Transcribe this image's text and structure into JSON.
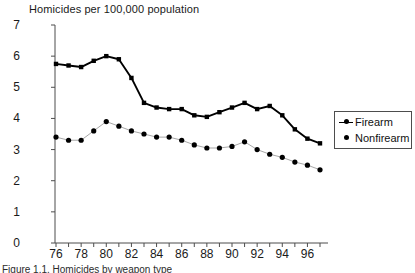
{
  "chart_data": {
    "type": "line",
    "title": "Homicides per 100,000 population",
    "xlabel": "",
    "ylabel": "",
    "ylim": [
      0,
      7
    ],
    "xlim": [
      1976,
      1997
    ],
    "yticks": [
      0,
      1,
      2,
      3,
      4,
      5,
      6,
      7
    ],
    "xticks": [
      1976,
      1977,
      1978,
      1979,
      1980,
      1981,
      1982,
      1983,
      1984,
      1985,
      1986,
      1987,
      1988,
      1989,
      1990,
      1991,
      1992,
      1993,
      1994,
      1995,
      1996,
      1997
    ],
    "xtick_labels_shown": [
      "76",
      "78",
      "80",
      "82",
      "84",
      "86",
      "88",
      "90",
      "92",
      "94",
      "96"
    ],
    "xtick_label_years": [
      1976,
      1978,
      1980,
      1982,
      1984,
      1986,
      1988,
      1990,
      1992,
      1994,
      1996
    ],
    "ytick_labels": [
      "0",
      "1",
      "2",
      "3",
      "4",
      "5",
      "6",
      "7"
    ],
    "grid": false,
    "legend_position": "right",
    "x": [
      1976,
      1977,
      1978,
      1979,
      1980,
      1981,
      1982,
      1983,
      1984,
      1985,
      1986,
      1987,
      1988,
      1989,
      1990,
      1991,
      1992,
      1993,
      1994,
      1995,
      1996,
      1997
    ],
    "series": [
      {
        "name": "Firearm",
        "color": "#000000",
        "marker": "square",
        "values": [
          5.75,
          5.7,
          5.65,
          5.85,
          6.0,
          5.9,
          5.3,
          4.5,
          4.35,
          4.3,
          4.3,
          4.1,
          4.05,
          4.2,
          4.35,
          4.5,
          4.3,
          4.4,
          4.1,
          3.65,
          3.35,
          3.2
        ]
      },
      {
        "name": "Nonfirearm",
        "color": "#000000",
        "marker": "circle",
        "values": [
          3.4,
          3.3,
          3.3,
          3.6,
          3.9,
          3.75,
          3.6,
          3.5,
          3.4,
          3.4,
          3.3,
          3.15,
          3.05,
          3.05,
          3.1,
          3.25,
          3.0,
          2.85,
          2.75,
          2.6,
          2.5,
          2.35
        ]
      }
    ]
  },
  "legend": {
    "items": [
      {
        "label": "Firearm"
      },
      {
        "label": "Nonfirearm"
      }
    ]
  },
  "caption": {
    "text": "Figure 1.1. Homicides by weapon type"
  }
}
